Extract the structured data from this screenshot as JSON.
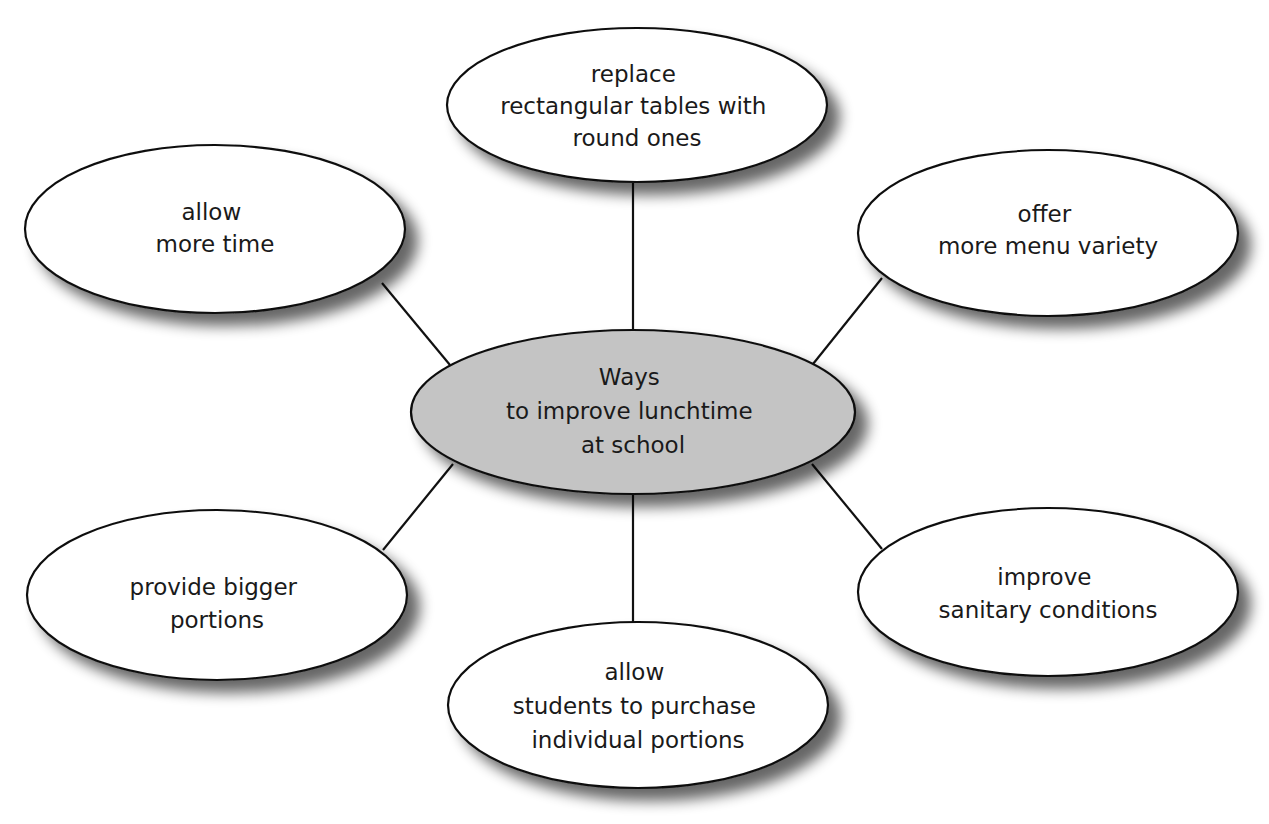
{
  "diagram": {
    "type": "mind-map",
    "colors": {
      "background": "#ffffff",
      "center_fill": "#c4c4c4",
      "node_fill": "#ffffff",
      "stroke": "#111111",
      "shadow": "#7a7a7a"
    },
    "center": {
      "lines": [
        "Ways",
        "to improve lunchtime",
        "at school"
      ]
    },
    "nodes": [
      {
        "id": "top",
        "lines": [
          "replace",
          "rectangular tables with",
          "round ones"
        ]
      },
      {
        "id": "top-left",
        "lines": [
          "allow",
          "more time"
        ]
      },
      {
        "id": "top-right",
        "lines": [
          "offer",
          "more menu variety"
        ]
      },
      {
        "id": "bottom-left",
        "lines": [
          "provide bigger",
          "portions"
        ]
      },
      {
        "id": "bottom",
        "lines": [
          "allow",
          "students to purchase",
          "individual portions"
        ]
      },
      {
        "id": "bottom-right",
        "lines": [
          "improve",
          "sanitary conditions"
        ]
      }
    ]
  }
}
